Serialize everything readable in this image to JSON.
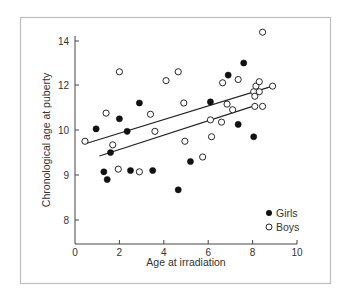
{
  "chart_data": {
    "type": "scatter",
    "title": "",
    "xlabel": "Age at irradiation",
    "ylabel": "Chronological age at puberty",
    "xlim": [
      0,
      10
    ],
    "ylim": [
      7.5,
      14.2
    ],
    "x_ticks": [
      0,
      2,
      4,
      6,
      8,
      10
    ],
    "y_ticks": [
      8,
      9,
      10,
      12,
      14
    ],
    "grid": false,
    "legend_position": "lower right",
    "series": [
      {
        "name": "Girls",
        "marker": "filled-circle",
        "color": "#111111",
        "points": [
          [
            0.95,
            10.05
          ],
          [
            1.3,
            9.07
          ],
          [
            1.45,
            8.9
          ],
          [
            1.6,
            9.5
          ],
          [
            2.0,
            10.5
          ],
          [
            2.35,
            9.97
          ],
          [
            2.5,
            9.1
          ],
          [
            2.9,
            11.2
          ],
          [
            3.5,
            9.1
          ],
          [
            4.65,
            8.67
          ],
          [
            5.2,
            9.3
          ],
          [
            6.1,
            11.25
          ],
          [
            6.9,
            12.45
          ],
          [
            7.35,
            10.25
          ],
          [
            7.6,
            13.0
          ],
          [
            8.05,
            9.85
          ]
        ],
        "fit_line": [
          [
            1.1,
            9.42
          ],
          [
            8.0,
            11.05
          ]
        ]
      },
      {
        "name": "Boys",
        "marker": "open-circle",
        "color": "#111111",
        "points": [
          [
            0.45,
            9.75
          ],
          [
            1.4,
            10.75
          ],
          [
            1.7,
            9.67
          ],
          [
            1.95,
            9.13
          ],
          [
            2.0,
            12.6
          ],
          [
            2.9,
            9.07
          ],
          [
            3.4,
            10.7
          ],
          [
            3.6,
            9.97
          ],
          [
            4.1,
            12.2
          ],
          [
            4.65,
            12.6
          ],
          [
            4.9,
            11.2
          ],
          [
            4.95,
            9.75
          ],
          [
            5.75,
            9.4
          ],
          [
            6.1,
            10.45
          ],
          [
            6.15,
            9.85
          ],
          [
            6.6,
            10.35
          ],
          [
            6.65,
            12.1
          ],
          [
            6.85,
            11.15
          ],
          [
            7.1,
            10.9
          ],
          [
            7.35,
            12.25
          ],
          [
            8.05,
            11.7
          ],
          [
            8.1,
            11.5
          ],
          [
            8.1,
            11.05
          ],
          [
            8.15,
            11.95
          ],
          [
            8.3,
            12.15
          ],
          [
            8.3,
            11.7
          ],
          [
            8.45,
            11.05
          ],
          [
            8.45,
            14.4
          ],
          [
            8.9,
            11.95
          ]
        ],
        "fit_line": [
          [
            0.5,
            9.7
          ],
          [
            8.9,
            11.95
          ]
        ]
      }
    ]
  },
  "legend": {
    "items": [
      {
        "label": "Girls",
        "marker": "filled-circle"
      },
      {
        "label": "Boys",
        "marker": "open-circle"
      }
    ]
  },
  "axes": {
    "x_title": "Age at irradiation",
    "y_title": "Chronological age at puberty",
    "x_tick_labels": [
      "0",
      "2",
      "4",
      "6",
      "8",
      "10"
    ],
    "y_tick_labels": [
      "8",
      "9",
      "10",
      "12",
      "14"
    ]
  },
  "colors": {
    "frame": "#bdbdbd",
    "axis": "#444444",
    "marker": "#111111",
    "background": "#ffffff"
  }
}
